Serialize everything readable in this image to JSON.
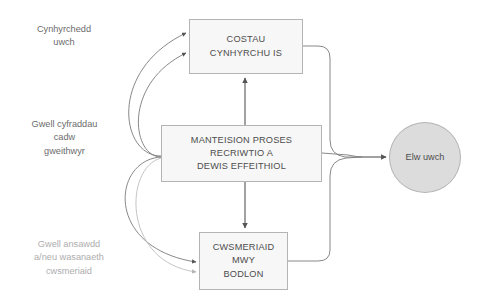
{
  "diagram": {
    "title": "Manteision proses recriwtio a dewis effeithiol",
    "colors": {
      "box_fill": "#f7f7f7",
      "box_stroke": "#b4b4b4",
      "ellipse_fill": "#dcdcdc",
      "ellipse_stroke": "#b4b4b4",
      "connector": "#7a7a7a",
      "connector_light": "#bdbdbd",
      "text_dark": "#4d4d4d",
      "text_muted": "#6b6b6b",
      "text_faint": "#adadad"
    },
    "labels": {
      "productivity": "Cynhyrchedd\nuwch",
      "retention": "Gwell cyfraddau\ncadw\ngweithwyr",
      "quality": "Gwell ansawdd\na/neu wasanaeth\ncwsmeriaid"
    },
    "nodes": {
      "lower_costs": "COSTAU\nCYNHYRCHU IS",
      "benefits": "MANTEISION PROSES\nRECRIWTIO A\nDEWIS EFFEITHIOL",
      "satisfied_customers": "CWSMERIAID\nMWY\nBODLON",
      "higher_profit": "Elw uwch"
    }
  }
}
